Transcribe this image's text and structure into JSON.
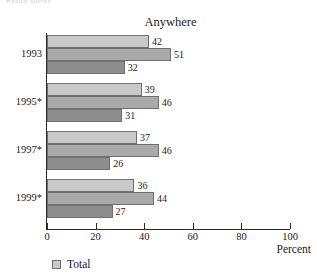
{
  "clipped_header": "Health Survey",
  "chart_data": {
    "type": "bar",
    "orientation": "horizontal",
    "title": "Anywhere",
    "xlabel": "Percent",
    "ylabel": "",
    "xlim": [
      0,
      100
    ],
    "xticks": [
      0,
      20,
      40,
      60,
      80,
      100
    ],
    "xtick_labels": [
      "0",
      "20",
      "40",
      "60",
      "80",
      "100"
    ],
    "grid": false,
    "legend_position": "bottom-left",
    "categories": [
      "1993",
      "1995*",
      "1997*",
      "1999*"
    ],
    "series": [
      {
        "name": "Total",
        "color": "#c9c9c9",
        "values": [
          42,
          39,
          37,
          36
        ]
      },
      {
        "name": "",
        "color": "#a9a9a9",
        "values": [
          51,
          46,
          46,
          44
        ]
      },
      {
        "name": "",
        "color": "#8e8e8e",
        "values": [
          32,
          31,
          26,
          27
        ]
      }
    ],
    "legend": [
      {
        "label": "Total",
        "color": "#c9c9c9"
      }
    ]
  }
}
